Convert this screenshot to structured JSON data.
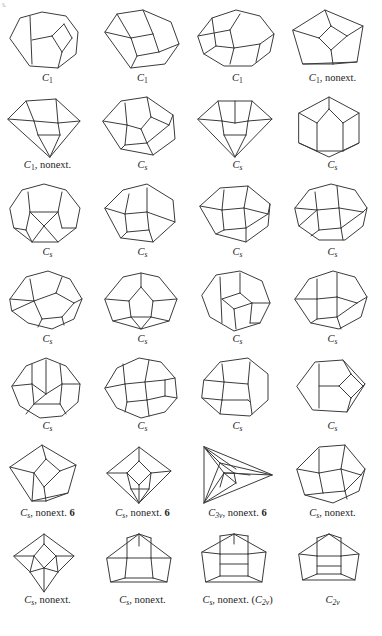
{
  "sheet": {
    "corner_mark": "s.",
    "width": 382,
    "height": 636,
    "background": "#ffffff",
    "stroke_color": "#3b3b3b",
    "text_color": "#1d1d1d"
  },
  "layout": {
    "columns": 4,
    "rows": 7,
    "cell_width": 95,
    "cell_height": 87,
    "caption_rows_y": [
      78,
      165,
      252,
      339,
      426,
      513,
      600
    ]
  },
  "figures": [
    {
      "index": 1,
      "row": 1,
      "col": 1,
      "caption": {
        "group": "C",
        "subscript": "1",
        "note": "",
        "count": "",
        "paren": ""
      },
      "caption_text": "C1",
      "shape": "octagon-with-inner-quad-and-two-vertical-chords",
      "polygon": "10,34 20,14 42,8 66,12 78,28 76,50 58,64 30,62",
      "inner": [
        "M30,12 L32,60",
        "M32,36 L52,32",
        "M52,32 L64,20",
        "M64,20 L72,34",
        "M72,34 L62,48",
        "M62,48 L52,32",
        "M62,48 L58,64"
      ]
    },
    {
      "index": 2,
      "row": 1,
      "col": 2,
      "caption": {
        "group": "C",
        "subscript": "1",
        "note": "",
        "count": "",
        "paren": ""
      },
      "caption_text": "C1",
      "shape": "heptagon-with-central-pentagon-and-square",
      "polygon": "10,28 22,10 48,6 76,18 84,40 70,60 36,64",
      "inner": [
        "M22,10 L36,34",
        "M36,34 L58,30",
        "M58,30 L48,6",
        "M58,30 L64,48",
        "M64,48 L84,40",
        "M36,34 L42,52",
        "M42,52 L64,48",
        "M42,52 L36,64",
        "M36,34 L10,28"
      ]
    },
    {
      "index": 3,
      "row": 1,
      "col": 3,
      "caption": {
        "group": "C",
        "subscript": "1",
        "note": "",
        "count": "",
        "paren": ""
      },
      "caption_text": "C1",
      "shape": "nonagon-with-three-inner-faces",
      "polygon": "8,32 22,14 46,6 70,12 84,30 80,48 62,62 34,62 14,50",
      "inner": [
        "M8,32 L40,26",
        "M40,26 L50,10",
        "M40,26 L44,44",
        "M44,44 L70,40",
        "M70,40 L84,30",
        "M44,44 L40,60",
        "M70,40 L66,58",
        "M14,50 L26,42",
        "M26,42 L44,44",
        "M26,42 L22,14"
      ]
    },
    {
      "index": 4,
      "row": 1,
      "col": 4,
      "caption": {
        "group": "C",
        "subscript": "1",
        "note": "nonext.",
        "count": "",
        "paren": ""
      },
      "caption_text": "C1, nonext.",
      "shape": "pentagon-with-central-diamond",
      "polygon": "8,26 40,6 78,22 72,58 18,60",
      "inner": [
        "M8,26 L34,34",
        "M34,34 L46,22",
        "M46,22 L40,6",
        "M46,22 L62,32",
        "M62,32 L78,22",
        "M34,34 L46,46",
        "M46,46 L62,32",
        "M46,46 L48,60",
        "M48,60 L18,60",
        "M48,60 L72,58"
      ]
    },
    {
      "index": 5,
      "row": 2,
      "col": 1,
      "caption": {
        "group": "C",
        "subscript": "1",
        "note": "nonext.",
        "count": "",
        "paren": ""
      },
      "caption_text": "C1, nonext.",
      "shape": "kite-with-inner-triangle",
      "polygon": "8,28 26,10 56,8 80,30 50,66",
      "inner": [
        "M8,28 L34,30",
        "M34,30 L26,10",
        "M34,30 L58,32",
        "M58,32 L80,30",
        "M58,32 L56,8",
        "M34,30 L38,44",
        "M38,44 L60,44",
        "M60,44 L58,32",
        "M38,44 L50,66",
        "M60,44 L50,66"
      ]
    },
    {
      "index": 6,
      "row": 2,
      "col": 2,
      "caption": {
        "group": "C",
        "subscript": "s",
        "note": "",
        "count": "",
        "paren": ""
      },
      "caption_text": "Cs",
      "shape": "heptagon-with-central-rhombus",
      "polygon": "8,30 26,10 52,6 78,24 80,48 58,64 26,58",
      "inner": [
        "M8,30 L32,34",
        "M32,34 L30,12",
        "M32,34 L46,38",
        "M46,38 L56,26",
        "M56,26 L52,6",
        "M56,26 L74,34",
        "M74,34 L78,24",
        "M46,38 L52,52",
        "M52,52 L74,34",
        "M32,34 L30,54",
        "M30,54 L52,52",
        "M30,54 L26,58",
        "M52,52 L58,64"
      ]
    },
    {
      "index": 7,
      "row": 2,
      "col": 3,
      "caption": {
        "group": "C",
        "subscript": "s",
        "note": "",
        "count": "",
        "paren": ""
      },
      "caption_text": "Cs",
      "shape": "kite-with-inner-triangle-symmetric",
      "polygon": "8,28 28,10 62,10 82,28 45,66",
      "inner": [
        "M8,28 L32,30",
        "M32,30 L28,10",
        "M32,30 L45,32",
        "M45,32 L45,10",
        "M45,32 L58,30",
        "M58,30 L82,28",
        "M58,30 L62,10",
        "M32,30 L34,44",
        "M34,44 L56,44",
        "M56,44 L58,30",
        "M34,44 L45,66",
        "M56,44 L45,66"
      ]
    },
    {
      "index": 8,
      "row": 2,
      "col": 4,
      "caption": {
        "group": "C",
        "subscript": "s",
        "note": "",
        "count": "",
        "paren": ""
      },
      "caption_text": "Cs",
      "shape": "hexagon-with-three-vertical-cells",
      "polygon": "14,22 44,6 74,22 74,52 44,66 14,52",
      "inner": [
        "M14,22 L32,32",
        "M32,32 L44,18",
        "M44,18 L44,6",
        "M44,18 L58,32",
        "M58,32 L74,22",
        "M32,32 L32,60",
        "M58,32 L58,60",
        "M32,60 L14,52",
        "M58,60 L74,52",
        "M32,60 L58,60"
      ]
    },
    {
      "index": 9,
      "row": 3,
      "col": 1,
      "caption": {
        "group": "C",
        "subscript": "s",
        "note": "",
        "count": "",
        "paren": ""
      },
      "caption_text": "Cs",
      "shape": "nonagon-with-vertical-band-and-bottom-triangle",
      "polygon": "10,30 22,12 44,6 66,12 80,30 76,50 58,64 32,64 14,50",
      "inner": [
        "M28,14 L30,34",
        "M30,34 L26,52",
        "M26,52 L14,50",
        "M30,34 L58,34",
        "M58,34 L62,14",
        "M58,34 L62,50",
        "M62,50 L76,50",
        "M30,34 L44,48",
        "M44,48 L58,34",
        "M44,48 L32,64",
        "M44,48 L58,64",
        "M26,52 L32,64"
      ]
    },
    {
      "index": 10,
      "row": 3,
      "col": 2,
      "caption": {
        "group": "C",
        "subscript": "s",
        "note": "",
        "count": "",
        "paren": ""
      },
      "caption_text": "Cs",
      "shape": "heptagon-tilted-with-inner-square",
      "polygon": "10,30 28,12 52,6 78,22 80,44 58,64 26,60",
      "inner": [
        "M10,30 L30,36",
        "M30,36 L34,16",
        "M30,36 L52,34",
        "M52,34 L52,10",
        "M52,34 L80,44",
        "M30,36 L32,54",
        "M32,54 L54,52",
        "M54,52 L52,34",
        "M32,54 L26,60",
        "M54,52 L58,64"
      ]
    },
    {
      "index": 11,
      "row": 3,
      "col": 3,
      "caption": {
        "group": "C",
        "subscript": "s",
        "note": "",
        "count": "",
        "paren": ""
      },
      "caption_text": "Cs",
      "shape": "heptagon-with-central-square-symmetric",
      "polygon": "10,28 30,10 58,8 80,26 78,48 56,64 26,56",
      "inner": [
        "M10,28 L32,32",
        "M32,32 L34,12",
        "M32,32 L54,30",
        "M54,30 L58,8",
        "M54,30 L78,36",
        "M78,36 L80,26",
        "M32,32 L34,52",
        "M34,52 L56,50",
        "M56,50 L54,30",
        "M56,50 L78,36",
        "M34,52 L26,56",
        "M56,50 L56,64"
      ]
    },
    {
      "index": 12,
      "row": 3,
      "col": 4,
      "caption": {
        "group": "C",
        "subscript": "s",
        "note": "",
        "count": "",
        "paren": ""
      },
      "caption_text": "Cs",
      "shape": "nonagon-with-central-square",
      "polygon": "10,30 24,12 46,6 70,12 82,30 78,48 60,62 34,62 14,48",
      "inner": [
        "M10,30 L32,32",
        "M32,32 L30,14",
        "M32,32 L54,30",
        "M54,30 L52,8",
        "M54,30 L78,34",
        "M78,34 L82,30",
        "M32,32 L34,52",
        "M34,52 L56,50",
        "M56,50 L54,30",
        "M56,50 L78,34",
        "M34,52 L26,58",
        "M56,50 L58,62",
        "M14,48 L32,32"
      ]
    },
    {
      "index": 13,
      "row": 4,
      "col": 1,
      "caption": {
        "group": "C",
        "subscript": "s",
        "note": "",
        "count": "",
        "paren": ""
      },
      "caption_text": "Cs",
      "shape": "nonagon-with-offset-pentagon",
      "polygon": "10,34 26,12 48,6 70,14 82,34 74,54 52,64 28,58 12,46",
      "inner": [
        "M10,34 L34,36",
        "M34,36 L30,14",
        "M34,36 L56,28",
        "M56,28 L62,12",
        "M56,28 L74,38",
        "M74,38 L82,34",
        "M34,36 L42,54",
        "M42,54 L62,52",
        "M62,52 L74,38",
        "M42,54 L38,62",
        "M62,52 L64,60",
        "M34,36 L12,46"
      ]
    },
    {
      "index": 14,
      "row": 4,
      "col": 2,
      "caption": {
        "group": "C",
        "subscript": "s",
        "note": "",
        "count": "",
        "paren": ""
      },
      "caption_text": "Cs",
      "shape": "octagon-with-central-diamond",
      "polygon": "10,34 28,12 46,8 64,12 82,34 74,56 46,64 18,56",
      "inner": [
        "M10,34 L34,36",
        "M34,36 L46,22",
        "M46,22 L46,8",
        "M46,22 L58,36",
        "M58,36 L82,34",
        "M34,36 L36,52",
        "M36,52 L56,52",
        "M56,52 L58,36",
        "M36,52 L18,56",
        "M56,52 L74,56",
        "M36,52 L46,64",
        "M56,52 L46,64"
      ]
    },
    {
      "index": 15,
      "row": 4,
      "col": 3,
      "caption": {
        "group": "C",
        "subscript": "s",
        "note": "",
        "count": "",
        "paren": ""
      },
      "caption_text": "Cs",
      "shape": "octagon-with-inner-diamond-and-chords",
      "polygon": "12,30 26,10 50,6 72,16 80,38 70,58 44,66 20,52",
      "inner": [
        "M30,12 L32,58",
        "M32,34 L50,28",
        "M50,28 L50,8",
        "M50,28 L62,38",
        "M62,38 L80,38",
        "M32,34 L44,44",
        "M44,44 L62,38",
        "M44,44 L46,64",
        "M62,38 L60,58",
        "M60,58 L70,58"
      ]
    },
    {
      "index": 16,
      "row": 4,
      "col": 4,
      "caption": {
        "group": "C",
        "subscript": "s",
        "note": "",
        "count": "",
        "paren": ""
      },
      "caption_text": "Cs",
      "shape": "octagon-with-square-and-pentagon",
      "polygon": "10,34 24,14 48,6 70,12 82,32 76,52 54,64 26,58",
      "inner": [
        "M10,34 L32,34",
        "M32,34 L32,14",
        "M32,34 L52,32",
        "M52,32 L52,8",
        "M52,32 L72,38",
        "M72,38 L82,32",
        "M32,34 L32,54",
        "M32,54 L52,52",
        "M52,52 L52,32",
        "M52,52 L72,38",
        "M32,54 L26,58",
        "M52,52 L56,64"
      ]
    },
    {
      "index": 17,
      "row": 5,
      "col": 1,
      "caption": {
        "group": "C",
        "subscript": "s",
        "note": "",
        "count": "",
        "paren": ""
      },
      "caption_text": "Cs",
      "shape": "decagon-with-central-pentagon",
      "polygon": "12,34 26,14 46,6 66,14 80,32 78,50 62,64 40,66 20,54",
      "inner": [
        "M12,34 L32,32",
        "M32,32 L32,12",
        "M32,32 L46,42",
        "M46,42 L46,8",
        "M46,42 L62,32",
        "M62,32 L80,32",
        "M62,32 L60,12",
        "M32,32 L34,52",
        "M34,52 L60,52",
        "M60,52 L62,32",
        "M34,52 L46,42",
        "M34,52 L26,62",
        "M60,52 L66,62"
      ]
    },
    {
      "index": 18,
      "row": 5,
      "col": 2,
      "caption": {
        "group": "C",
        "subscript": "s",
        "note": "",
        "count": "",
        "paren": ""
      },
      "caption_text": "Cs",
      "shape": "round-polygon-with-tilted-faces",
      "polygon": "10,36 22,16 44,6 66,10 80,26 82,46 70,60 46,66 22,56",
      "inner": [
        "M10,36 L30,32",
        "M30,32 L28,12",
        "M30,32 L50,30",
        "M50,30 L54,8",
        "M50,30 L70,28",
        "M70,28 L80,26",
        "M30,32 L32,50",
        "M32,50 L52,48",
        "M52,48 L50,30",
        "M52,48 L70,44",
        "M70,44 L70,28",
        "M70,44 L82,46",
        "M32,50 L30,60",
        "M52,48 L54,64"
      ]
    },
    {
      "index": 19,
      "row": 5,
      "col": 3,
      "caption": {
        "group": "C",
        "subscript": "s",
        "note": "",
        "count": "",
        "paren": ""
      },
      "caption_text": "Cs",
      "shape": "octagon-with-two-vertical-bands",
      "polygon": "14,28 30,10 58,6 78,22 78,48 60,64 30,62 12,46",
      "inner": [
        "M32,12 L34,30",
        "M34,30 L32,48",
        "M32,48 L30,62",
        "M34,30 L58,32",
        "M58,32 L60,10",
        "M58,32 L62,62",
        "M32,48 L58,48",
        "M58,48 L60,50",
        "M12,46 L32,48",
        "M34,30 L14,28"
      ]
    },
    {
      "index": 20,
      "row": 5,
      "col": 4,
      "caption": {
        "group": "C",
        "subscript": "s",
        "note": "",
        "count": "",
        "paren": ""
      },
      "caption_text": "Cs",
      "shape": "hexagon-with-right-diamond",
      "polygon": "12,34 30,10 58,8 80,32 62,60 28,58",
      "inner": [
        "M34,12 L34,56",
        "M34,34 L54,34",
        "M54,34 L66,22",
        "M66,22 L58,8",
        "M66,22 L78,34",
        "M78,34 L80,32",
        "M54,34 L66,46",
        "M66,46 L78,34",
        "M66,46 L62,60"
      ]
    },
    {
      "index": 21,
      "row": 6,
      "col": 1,
      "caption": {
        "group": "C",
        "subscript": "s",
        "note": "nonext.",
        "count": "6",
        "paren": ""
      },
      "caption_text": "Cs, nonext. 6",
      "shape": "pentagon-with-central-diamond",
      "polygon": "10,28 42,6 76,26 68,54 32,62",
      "inner": [
        "M10,28 L34,34",
        "M34,34 L46,20",
        "M46,20 L42,6",
        "M46,20 L60,32",
        "M60,32 L76,26",
        "M34,34 L44,48",
        "M44,48 L60,32",
        "M44,48 L46,62",
        "M46,62 L32,62",
        "M46,62 L68,54",
        "M34,34 L32,62"
      ]
    },
    {
      "index": 22,
      "row": 6,
      "col": 2,
      "caption": {
        "group": "C",
        "subscript": "s",
        "note": "nonext.",
        "count": "6",
        "paren": ""
      },
      "caption_text": "Cs, nonext. 6",
      "shape": "diamond-with-inner-diamond-and-triangle",
      "polygon": "12,34 44,8 76,32 44,64",
      "inner": [
        "M12,34 L32,34",
        "M32,34 L44,22",
        "M44,22 L44,8",
        "M44,22 L56,34",
        "M56,34 L76,32",
        "M32,34 L44,46",
        "M44,46 L56,34",
        "M32,34 L36,50",
        "M36,50 L54,50",
        "M54,50 L56,34",
        "M36,50 L44,64",
        "M54,50 L44,64",
        "M44,46 L44,64"
      ]
    },
    {
      "index": 23,
      "row": 6,
      "col": 3,
      "caption": {
        "group": "C",
        "subscript": "3v",
        "note": "nonext.",
        "count": "6",
        "paren": ""
      },
      "caption_text": "C3v, nonext. 6",
      "shape": "triangle-with-nested-triangles",
      "polygon": "14,8 14,64 82,36",
      "inner": [
        "M14,8 L30,24",
        "M30,24 L14,64",
        "M30,24 L82,36",
        "M14,8 L34,34",
        "M34,34 L14,64",
        "M34,34 L82,36",
        "M30,24 L44,34",
        "M44,34 L34,34",
        "M44,34 L46,44",
        "M46,44 L34,34",
        "M44,34 L60,36",
        "M30,48 L34,34",
        "M14,8 L46,30",
        "M14,64 L46,44"
      ]
    },
    {
      "index": 24,
      "row": 6,
      "col": 4,
      "caption": {
        "group": "C",
        "subscript": "s",
        "note": "nonext.",
        "count": "",
        "paren": ""
      },
      "caption_text": "Cs, nonext.",
      "shape": "heptagon-with-central-pentagon",
      "polygon": "12,30 34,8 60,6 80,30 74,52 48,64 20,56",
      "inner": [
        "M12,30 L34,34",
        "M34,34 L34,10",
        "M34,34 L56,30",
        "M56,30 L60,6",
        "M56,30 L76,36",
        "M76,36 L80,30",
        "M34,34 L38,54",
        "M38,54 L60,52",
        "M60,52 L56,30",
        "M60,52 L76,36",
        "M38,54 L20,56",
        "M60,52 L62,60"
      ]
    },
    {
      "index": 25,
      "row": 7,
      "col": 1,
      "caption": {
        "group": "C",
        "subscript": "s",
        "note": "nonext.",
        "count": "",
        "paren": ""
      },
      "caption_text": "Cs, nonext.",
      "shape": "pentagon-with-central-diamond-and-bottom-apex",
      "polygon": "14,30 44,8 74,30 58,46 44,66 30,46",
      "inner": [
        "M14,30 L34,30",
        "M34,30 L44,18",
        "M44,18 L44,8",
        "M44,18 L56,30",
        "M56,30 L74,30",
        "M34,30 L44,42",
        "M44,42 L56,30",
        "M34,30 L30,46",
        "M56,30 L58,46",
        "M44,42 L30,46",
        "M44,42 L58,46",
        "M44,42 L44,66"
      ]
    },
    {
      "index": 26,
      "row": 7,
      "col": 2,
      "caption": {
        "group": "C",
        "subscript": "s",
        "note": "nonext.",
        "count": "",
        "paren": ""
      },
      "caption_text": "Cs, nonext.",
      "shape": "hexagon-with-central-pentagon",
      "polygon": "12,32 44,8 76,32 72,56 16,56",
      "inner": [
        "M12,32 L32,32",
        "M32,32 L32,12",
        "M32,32 L56,32",
        "M56,32 L56,12",
        "M56,32 L76,32",
        "M32,32 L30,52",
        "M30,52 L58,52",
        "M58,52 L56,32",
        "M30,52 L16,56",
        "M58,52 L72,56",
        "M44,8 L44,20",
        "M32,12 L44,8",
        "M56,12 L44,8"
      ]
    },
    {
      "index": 27,
      "row": 7,
      "col": 3,
      "caption": {
        "group": "C",
        "subscript": "s",
        "note": "nonext.",
        "count": "",
        "paren": "(C2v)"
      },
      "caption_text": "Cs, nonext. (C2v)",
      "shape": "hexagon-with-central-rectangle-divided",
      "polygon": "12,26 44,8 76,26 72,56 16,56",
      "inner": [
        "M12,26 L30,28",
        "M30,28 L30,10",
        "M30,28 L58,28",
        "M58,28 L58,10",
        "M58,28 L76,26",
        "M30,28 L30,50",
        "M58,28 L58,50",
        "M30,50 L58,50",
        "M30,50 L16,56",
        "M58,50 L72,56",
        "M30,38 L58,38",
        "M30,10 L44,8",
        "M58,10 L44,8",
        "M44,8 L44,18"
      ]
    },
    {
      "index": 28,
      "row": 7,
      "col": 4,
      "caption": {
        "group": "C",
        "subscript": "2v",
        "note": "",
        "count": "",
        "paren": ""
      },
      "caption_text": "C2v",
      "shape": "hexagon-with-central-rectangle-divided-symmetric",
      "polygon": "14,28 44,8 74,28 70,54 18,54",
      "inner": [
        "M14,28 L32,30",
        "M32,30 L32,12",
        "M32,30 L56,30",
        "M56,30 L56,12",
        "M56,30 L74,28",
        "M32,30 L32,48",
        "M56,30 L56,48",
        "M32,48 L56,48",
        "M32,48 L18,54",
        "M56,48 L70,54",
        "M32,40 L56,40",
        "M32,12 L44,8",
        "M56,12 L44,8"
      ]
    }
  ]
}
